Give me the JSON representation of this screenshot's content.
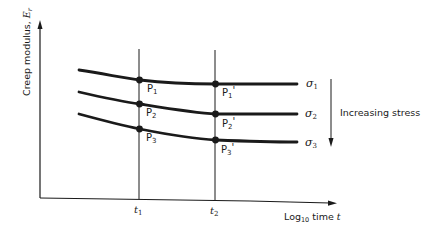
{
  "diagram": {
    "type": "creep-modulus-vs-log-time",
    "y_axis": {
      "label": "Creep modulus, ",
      "label_symbol": "E",
      "label_sub": "r"
    },
    "x_axis": {
      "label_prefix": "Log",
      "label_sub": "10",
      "label_suffix": " time ",
      "label_symbol": "t"
    },
    "time_markers": [
      {
        "symbol": "t",
        "sub": "1"
      },
      {
        "symbol": "t",
        "sub": "2"
      }
    ],
    "curves": [
      {
        "stress_symbol": "σ",
        "stress_sub": "1",
        "points": [
          {
            "label": "P",
            "sub": "1",
            "prime": ""
          },
          {
            "label": "P",
            "sub": "1",
            "prime": "'"
          }
        ]
      },
      {
        "stress_symbol": "σ",
        "stress_sub": "2",
        "points": [
          {
            "label": "P",
            "sub": "2",
            "prime": ""
          },
          {
            "label": "P",
            "sub": "2",
            "prime": "'"
          }
        ]
      },
      {
        "stress_symbol": "σ",
        "stress_sub": "3",
        "points": [
          {
            "label": "P",
            "sub": "3",
            "prime": ""
          },
          {
            "label": "P",
            "sub": "3",
            "prime": "'"
          }
        ]
      }
    ],
    "stress_arrow_label": "Increasing stress"
  },
  "colors": {
    "ink": "#1a1a1a",
    "background": "#ffffff"
  }
}
